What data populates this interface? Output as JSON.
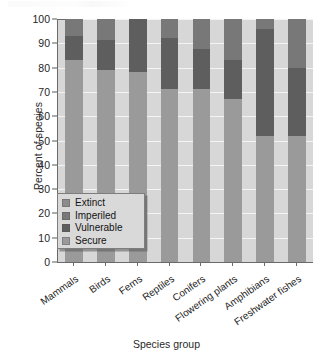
{
  "chart_data": {
    "type": "bar",
    "subtype": "stacked-bar-100-percent",
    "title": "",
    "xlabel": "Species group",
    "ylabel": "Percent of species",
    "ylim": [
      0,
      100
    ],
    "yticks": [
      0,
      10,
      20,
      30,
      40,
      50,
      60,
      70,
      80,
      90,
      100
    ],
    "grid": "horizontal",
    "legend_position": "inside-lower-left",
    "categories": [
      "Mammals",
      "Birds",
      "Ferns",
      "Reptiles",
      "Conifers",
      "Flowering plants",
      "Amphibians",
      "Freshwater fishes"
    ],
    "series": [
      {
        "name": "Secure",
        "color": "#9a9a9a",
        "values": [
          83,
          79,
          78,
          71,
          71,
          67,
          52,
          52
        ]
      },
      {
        "name": "Vulnerable",
        "color": "#5e5e5e",
        "values": [
          10,
          12.5,
          22,
          21,
          16.5,
          16,
          44,
          28
        ]
      },
      {
        "name": "Imperiled",
        "color": "#787878",
        "values": [
          7,
          8.5,
          0,
          8,
          12.5,
          17,
          4,
          20
        ]
      },
      {
        "name": "Extinct",
        "color": "#8c8c8c",
        "values": [
          0,
          0,
          0,
          0,
          0,
          0,
          0,
          0
        ]
      }
    ],
    "legend_entries": [
      {
        "label": "Extinct",
        "color": "#8c8c8c"
      },
      {
        "label": "Imperiled",
        "color": "#787878"
      },
      {
        "label": "Vulnerable",
        "color": "#5e5e5e"
      },
      {
        "label": "Secure",
        "color": "#9a9a9a"
      }
    ],
    "stack_tops": {
      "note_secure_top": [
        83,
        79,
        78,
        71,
        71,
        67,
        52,
        52
      ],
      "note_vulnerable_top": [
        93,
        91.5,
        100,
        92,
        87.5,
        83,
        96,
        80
      ],
      "note_imperiled_top": [
        100,
        100,
        100,
        100,
        100,
        100,
        100,
        100
      ]
    }
  },
  "colors": {
    "plot_background": "#d7d7d7",
    "page_background": "#ffffff",
    "axis": "#6a6a6a",
    "gridline": "#ffffff",
    "secure": "#9a9a9a",
    "vulnerable": "#5e5e5e",
    "imperiled": "#787878",
    "extinct": "#8c8c8c",
    "legend_background": "#d9d9d9",
    "legend_border": "#7d7d7d",
    "text": "#1f1f1f"
  }
}
